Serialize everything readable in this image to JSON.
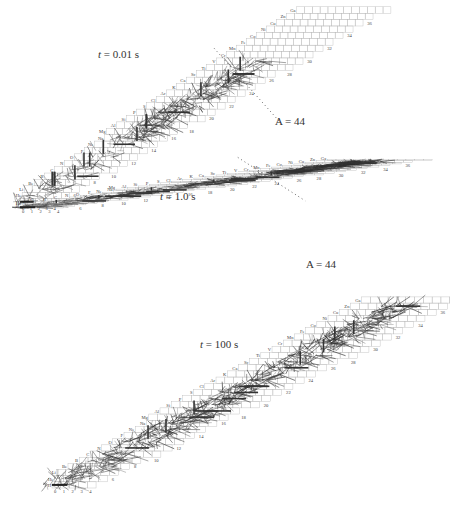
{
  "figure": {
    "panels": [
      {
        "id": "t001",
        "time_label": "t = 0.01 s",
        "time_var": "t",
        "time_value": "= 0.01 s",
        "mass_line_label": "A = 44",
        "density": 0.55,
        "heavy_end_fraction": 0.55
      },
      {
        "id": "t1",
        "time_label": "t = 1.0 s",
        "time_var": "t",
        "time_value": "= 1.0 s",
        "mass_line_label": "A = 44",
        "density": 0.8,
        "heavy_end_fraction": 1.0
      },
      {
        "id": "t100",
        "time_label": "t = 100 s",
        "time_var": "t",
        "time_value": "= 100 s",
        "mass_line_label": "",
        "density": 0.95,
        "heavy_end_fraction": 1.0
      }
    ],
    "elements": [
      "H",
      "He",
      "Li",
      "Be",
      "B",
      "C",
      "N",
      "O",
      "F",
      "Ne",
      "Na",
      "Mg",
      "Al",
      "Si",
      "P",
      "S",
      "Cl",
      "Ar",
      "K",
      "Ca",
      "Sc",
      "Ti",
      "V",
      "Cr",
      "Mn",
      "Fe",
      "Co",
      "Ni",
      "Cu",
      "Zn",
      "Ga"
    ],
    "neutron_number_labels": [
      "0",
      "1",
      "2",
      "3",
      "4",
      "6",
      "8",
      "10",
      "12",
      "14",
      "16",
      "18",
      "20",
      "22",
      "24",
      "26",
      "28",
      "30",
      "32",
      "34",
      "36"
    ],
    "mass_line": "A = 44"
  }
}
